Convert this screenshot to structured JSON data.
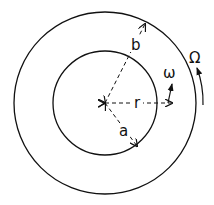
{
  "diagram": {
    "type": "concentric-cylinders",
    "center": [
      105,
      103
    ],
    "outer_circle": {
      "radius": 91,
      "label": "b"
    },
    "inner_circle": {
      "radius": 52,
      "label": "a"
    },
    "labels": {
      "b": "b",
      "a": "a",
      "r": "r",
      "omega_small": "ω",
      "omega_big": "Ω"
    }
  }
}
